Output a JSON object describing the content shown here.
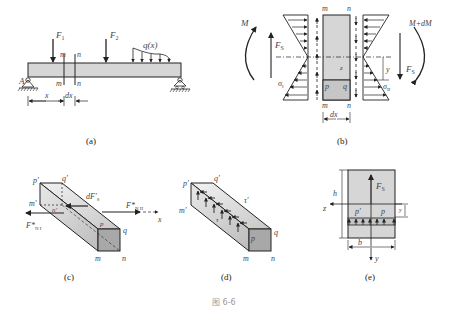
{
  "figure_caption": "图 6-6",
  "panels": {
    "a": {
      "caption": "(a)",
      "labels": {
        "F1": "F",
        "F1_sub": "1",
        "F2": "F",
        "F2_sub": "2",
        "q": "q(x)",
        "A": "A",
        "m_top": "m",
        "n_top": "n",
        "m_bot": "m",
        "n_bot": "n",
        "x": "x",
        "dx": "dx"
      }
    },
    "b": {
      "caption": "(b)",
      "labels": {
        "M": "M",
        "M_dM": "M+dM",
        "Fs_left": "F",
        "Fs_left_sub": "S",
        "Fs_right": "F",
        "Fs_right_sub": "S",
        "m_top": "m",
        "n_top": "n",
        "m_bot": "m",
        "n_bot": "n",
        "z": "z",
        "p": "p",
        "q": "q",
        "y": "y",
        "sigma1": "σ",
        "sigma1_sub": "I",
        "sigma2": "σ",
        "sigma2_sub": "II",
        "dx": "dx"
      }
    },
    "c": {
      "caption": "(c)",
      "labels": {
        "p_prime": "p′",
        "q_prime": "q′",
        "m_prime": "m′",
        "n_prime": "n′",
        "dFs": "dF′",
        "dFs_sub": "S",
        "FN1": "F*",
        "FN1_sub": "N I",
        "FN2": "F*",
        "FN2_sub": "N II",
        "x": "x",
        "p": "p",
        "q": "q",
        "m": "m",
        "n": "n"
      }
    },
    "d": {
      "caption": "(d)",
      "labels": {
        "p_prime": "p′",
        "q_prime": "q′",
        "m_prime": "m′",
        "tau_prime": "τ′",
        "tau": "τ",
        "p": "p",
        "q": "q",
        "m": "m",
        "n": "n"
      }
    },
    "e": {
      "caption": "(e)",
      "labels": {
        "h": "h",
        "Fs": "F",
        "Fs_sub": "S",
        "z": "z",
        "p_prime": "p′",
        "p": "p",
        "y_small": "y",
        "b": "b",
        "y": "y"
      }
    }
  },
  "colors": {
    "fill_gray": "#d6d6d6",
    "fill_dark": "#a8a8a8",
    "line": "#222222",
    "label": "#555555"
  }
}
